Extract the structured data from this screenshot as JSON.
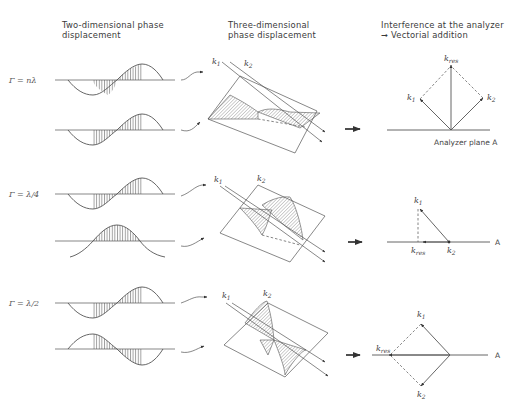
{
  "headers": {
    "col1": "Two-dimensional phase\ndisplacement",
    "col2": "Three-dimensional\nphase displacement",
    "col3": "Interference at the analyzer\n➞ Vectorial addition"
  },
  "rows": [
    {
      "gamma_label": "Γ = nλ",
      "k1": "k",
      "k1_sub": "1",
      "k2": "k",
      "k2_sub": "2",
      "kres": "k",
      "kres_sub": "res",
      "plane_label": "Analyzer plane A",
      "result": "constructive"
    },
    {
      "gamma_label": "Γ = λ/4",
      "k1": "k",
      "k1_sub": "1",
      "k2": "k",
      "k2_sub": "2",
      "kres": "k",
      "kres_sub": "res",
      "plane_label": "A",
      "result": "partial"
    },
    {
      "gamma_label": "Γ = λ/2",
      "k1": "k",
      "k1_sub": "1",
      "k2": "k",
      "k2_sub": "2",
      "kres": "k",
      "kres_sub": "res",
      "plane_label": "A",
      "result": "opposite"
    }
  ],
  "colors": {
    "line": "#555555",
    "background": "#ffffff"
  }
}
